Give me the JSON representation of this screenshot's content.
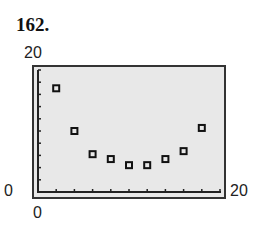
{
  "problem": {
    "number": "162."
  },
  "axes": {
    "y_max_label": "20",
    "y_min_label": "0",
    "x_min_label": "0",
    "x_max_label": "20"
  },
  "colors": {
    "plot_background": "#e8e8e8",
    "frame": "#333333",
    "marker": "#111111"
  },
  "chart_data": {
    "type": "scatter",
    "title": "162.",
    "xlabel": "",
    "ylabel": "",
    "xlim": [
      0,
      20
    ],
    "ylim": [
      0,
      20
    ],
    "x_tick_step": 2,
    "y_tick_step": 2,
    "grid": false,
    "legend": null,
    "marker": "hollow-square",
    "points": [
      {
        "x": 2,
        "y": 17
      },
      {
        "x": 4,
        "y": 10
      },
      {
        "x": 6,
        "y": 6.2
      },
      {
        "x": 8,
        "y": 5.4
      },
      {
        "x": 10,
        "y": 4.4
      },
      {
        "x": 12,
        "y": 4.4
      },
      {
        "x": 14,
        "y": 5.4
      },
      {
        "x": 16,
        "y": 6.7
      },
      {
        "x": 18,
        "y": 10.5
      }
    ]
  }
}
